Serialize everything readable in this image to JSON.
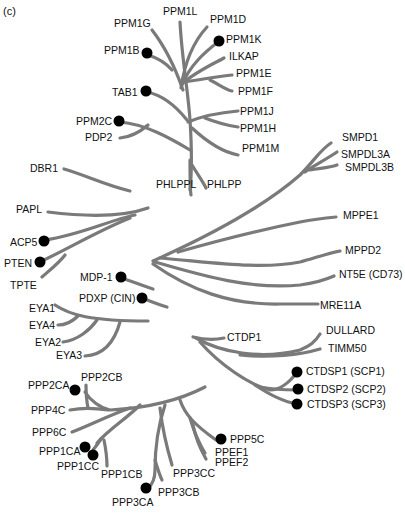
{
  "panel_label": "(c)",
  "clusters": {
    "ppm": {
      "leaves": [
        "PPM1G",
        "PPM1L",
        "PPM1D",
        "PPM1K",
        "PPM1B",
        "ILKAP",
        "PPM1E",
        "PPM1F",
        "TAB1",
        "PPM1J",
        "PPM1H",
        "PPM1M",
        "PPM2C",
        "PDP2",
        "PHLPPL",
        "PHLPP"
      ],
      "marked": [
        "PPM1K",
        "PPM1B",
        "TAB1",
        "PPM2C"
      ]
    },
    "dbr": {
      "leaves": [
        "DBR1"
      ],
      "marked": []
    },
    "pap": {
      "leaves": [
        "PAPL",
        "ACP5",
        "PTEN",
        "TPTE"
      ],
      "marked": [
        "ACP5",
        "PTEN"
      ]
    },
    "mpp": {
      "leaves": [
        "SMPD1",
        "SMPDL3A",
        "SMPDL3B",
        "MPPE1",
        "MPPD2",
        "NT5E (CD73)",
        "MRE11A"
      ],
      "marked": []
    },
    "had": {
      "leaves": [
        "MDP-1",
        "PDXP (CIN)"
      ],
      "marked": [
        "MDP-1",
        "PDXP (CIN)"
      ]
    },
    "eya": {
      "leaves": [
        "EYA1",
        "EYA4",
        "EYA2",
        "EYA3"
      ],
      "marked": []
    },
    "fcp": {
      "leaves": [
        "CTDP1",
        "DULLARD",
        "TIMM50",
        "CTDSP1 (SCP1)",
        "CTDSP2 (SCP2)",
        "CTDSP3 (SCP3)"
      ],
      "marked": [
        "CTDSP1 (SCP1)",
        "CTDSP2 (SCP2)",
        "CTDSP3 (SCP3)"
      ]
    },
    "ppp": {
      "leaves": [
        "PPP2CA",
        "PPP2CB",
        "PPP4C",
        "PPP6C",
        "PPP1CA",
        "PPP1CC",
        "PPP1CB",
        "PPP3CA",
        "PPP3CB",
        "PPP3CC",
        "PPEF1",
        "PPEF2",
        "PPP5C"
      ],
      "marked": [
        "PPP2CA",
        "PPP1CA",
        "PPP1CC",
        "PPP3CA",
        "PPP5C"
      ]
    }
  },
  "labels": {
    "PPM1G": "PPM1G",
    "PPM1L": "PPM1L",
    "PPM1D": "PPM1D",
    "PPM1K": "PPM1K",
    "PPM1B": "PPM1B",
    "ILKAP": "ILKAP",
    "PPM1E": "PPM1E",
    "PPM1F": "PPM1F",
    "TAB1": "TAB1",
    "PPM1J": "PPM1J",
    "PPM1H": "PPM1H",
    "PPM1M": "PPM1M",
    "PPM2C": "PPM2C",
    "PDP2": "PDP2",
    "PHLPPL": "PHLPPL",
    "PHLPP": "PHLPP",
    "DBR1": "DBR1",
    "PAPL": "PAPL",
    "ACP5": "ACP5",
    "PTEN": "PTEN",
    "TPTE": "TPTE",
    "SMPD1": "SMPD1",
    "SMPDL3A": "SMPDL3A",
    "SMPDL3B": "SMPDL3B",
    "MPPE1": "MPPE1",
    "MPPD2": "MPPD2",
    "NT5E": "NT5E (CD73)",
    "MRE11A": "MRE11A",
    "MDP1": "MDP-1",
    "PDXP": "PDXP (CIN)",
    "EYA1": "EYA1",
    "EYA4": "EYA4",
    "EYA2": "EYA2",
    "EYA3": "EYA3",
    "CTDP1": "CTDP1",
    "DULLARD": "DULLARD",
    "TIMM50": "TIMM50",
    "CTDSP1": "CTDSP1 (SCP1)",
    "CTDSP2": "CTDSP2 (SCP2)",
    "CTDSP3": "CTDSP3 (SCP3)",
    "PPP2CA": "PPP2CA",
    "PPP2CB": "PPP2CB",
    "PPP4C": "PPP4C",
    "PPP6C": "PPP6C",
    "PPP1CA": "PPP1CA",
    "PPP1CC": "PPP1CC",
    "PPP1CB": "PPP1CB",
    "PPP3CA": "PPP3CA",
    "PPP3CB": "PPP3CB",
    "PPP3CC": "PPP3CC",
    "PPEF1": "PPEF1",
    "PPEF2": "PPEF2",
    "PPP5C": "PPP5C"
  },
  "colors": {
    "branch": "#7a7a7a",
    "marker": "#000000",
    "text": "#111111"
  }
}
